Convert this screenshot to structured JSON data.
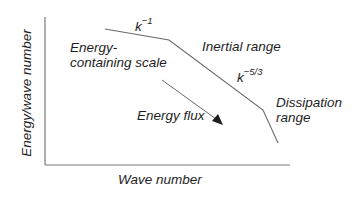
{
  "diagram": {
    "axes": {
      "x_label": "Wave number",
      "y_label": "Energy/wave number"
    },
    "regions": {
      "energy_containing": [
        "Energy-",
        "containing scale"
      ],
      "inertial": "Inertial range",
      "dissipation": [
        "Dissipation",
        "range"
      ]
    },
    "slopes": {
      "low_k": {
        "base": "k",
        "exponent": "−1"
      },
      "inertial": {
        "base": "k",
        "exponent": "−5/3"
      }
    },
    "flux_label": "Energy flux",
    "colors": {
      "line": "#6a6a6a",
      "text": "#1e1e1e",
      "background": "#ffffff"
    }
  }
}
